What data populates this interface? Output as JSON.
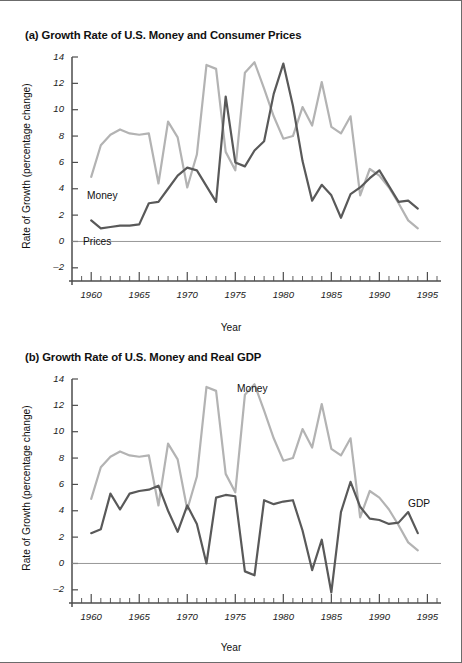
{
  "figure": {
    "panels": [
      {
        "key": "a",
        "title": "(a) Growth Rate of U.S. Money and Consumer Prices",
        "series_labels": {
          "money": "Money",
          "prices": "Prices"
        }
      },
      {
        "key": "b",
        "title": "(b) Growth Rate of U.S. Money and Real GDP",
        "series_labels": {
          "money": "Money",
          "gdp": "GDP"
        }
      }
    ],
    "colors": {
      "money_line": "#b3b3b3",
      "dark_line": "#595959",
      "axis": "#4d4d4d",
      "zero_line": "#8c8c8c",
      "text": "#111111",
      "page_border": "#6b6b6b"
    }
  },
  "chart_data": [
    {
      "type": "line",
      "title": "(a) Growth Rate of U.S. Money and Consumer Prices",
      "xlabel": "Year",
      "ylabel": "Rate of Growth (percentage change)",
      "xlim": [
        1958,
        1996
      ],
      "ylim": [
        -3,
        14
      ],
      "xticks": [
        1960,
        1965,
        1970,
        1975,
        1980,
        1985,
        1990,
        1995
      ],
      "yticks": [
        -2,
        0,
        2,
        4,
        6,
        8,
        10,
        12,
        14
      ],
      "grid": false,
      "legend": "inline-labels",
      "x": [
        1960,
        1961,
        1962,
        1963,
        1964,
        1965,
        1966,
        1967,
        1968,
        1969,
        1970,
        1971,
        1972,
        1973,
        1974,
        1975,
        1976,
        1977,
        1978,
        1979,
        1980,
        1981,
        1982,
        1983,
        1984,
        1985,
        1986,
        1987,
        1988,
        1989,
        1990,
        1991,
        1992,
        1993,
        1994
      ],
      "series": [
        {
          "name": "Money",
          "color": "#b3b3b3",
          "values": [
            4.9,
            7.3,
            8.1,
            8.5,
            8.2,
            8.1,
            8.2,
            4.4,
            9.1,
            7.9,
            4.1,
            6.6,
            13.4,
            13.1,
            6.8,
            5.4,
            12.8,
            13.6,
            11.6,
            9.5,
            7.8,
            8.0,
            10.2,
            8.8,
            12.1,
            8.7,
            8.2,
            9.5,
            3.5,
            5.5,
            5.0,
            4.1,
            2.9,
            1.6,
            1.0
          ]
        },
        {
          "name": "Prices",
          "color": "#595959",
          "values": [
            1.6,
            1.0,
            1.1,
            1.2,
            1.2,
            1.3,
            2.9,
            3.0,
            4.0,
            5.0,
            5.6,
            5.4,
            4.2,
            3.0,
            11.0,
            6.0,
            5.7,
            6.9,
            7.6,
            11.2,
            13.5,
            10.3,
            6.1,
            3.1,
            4.3,
            3.5,
            1.8,
            3.6,
            4.1,
            4.8,
            5.4,
            4.2,
            3.0,
            3.1,
            2.5
          ]
        }
      ]
    },
    {
      "type": "line",
      "title": "(b) Growth Rate of U.S. Money and Real GDP",
      "xlabel": "Year",
      "ylabel": "Rate of Growth (percentage change)",
      "xlim": [
        1958,
        1996
      ],
      "ylim": [
        -3,
        14
      ],
      "xticks": [
        1960,
        1965,
        1970,
        1975,
        1980,
        1985,
        1990,
        1995
      ],
      "yticks": [
        -2,
        0,
        2,
        4,
        6,
        8,
        10,
        12,
        14
      ],
      "grid": false,
      "legend": "inline-labels",
      "x": [
        1960,
        1961,
        1962,
        1963,
        1964,
        1965,
        1966,
        1967,
        1968,
        1969,
        1970,
        1971,
        1972,
        1973,
        1974,
        1975,
        1976,
        1977,
        1978,
        1979,
        1980,
        1981,
        1982,
        1983,
        1984,
        1985,
        1986,
        1987,
        1988,
        1989,
        1990,
        1991,
        1992,
        1993,
        1994
      ],
      "series": [
        {
          "name": "Money",
          "color": "#b3b3b3",
          "values": [
            4.9,
            7.3,
            8.1,
            8.5,
            8.2,
            8.1,
            8.2,
            4.4,
            9.1,
            7.9,
            4.1,
            6.6,
            13.4,
            13.1,
            6.8,
            5.4,
            12.8,
            13.6,
            11.6,
            9.5,
            7.8,
            8.0,
            10.2,
            8.8,
            12.1,
            8.7,
            8.2,
            9.5,
            3.5,
            5.5,
            5.0,
            4.1,
            2.9,
            1.6,
            1.0
          ]
        },
        {
          "name": "GDP",
          "color": "#595959",
          "values": [
            2.3,
            2.6,
            5.3,
            4.1,
            5.3,
            5.5,
            5.6,
            5.9,
            4.0,
            2.4,
            4.4,
            3.0,
            0.0,
            5.0,
            5.2,
            5.1,
            -0.6,
            -0.9,
            4.8,
            4.5,
            4.7,
            4.8,
            2.5,
            -0.5,
            1.8,
            -2.2,
            3.9,
            6.2,
            4.3,
            3.4,
            3.3,
            3.0,
            3.1,
            3.9,
            2.3,
            -1.0,
            1.7,
            2.2,
            3.9
          ]
        }
      ]
    }
  ]
}
